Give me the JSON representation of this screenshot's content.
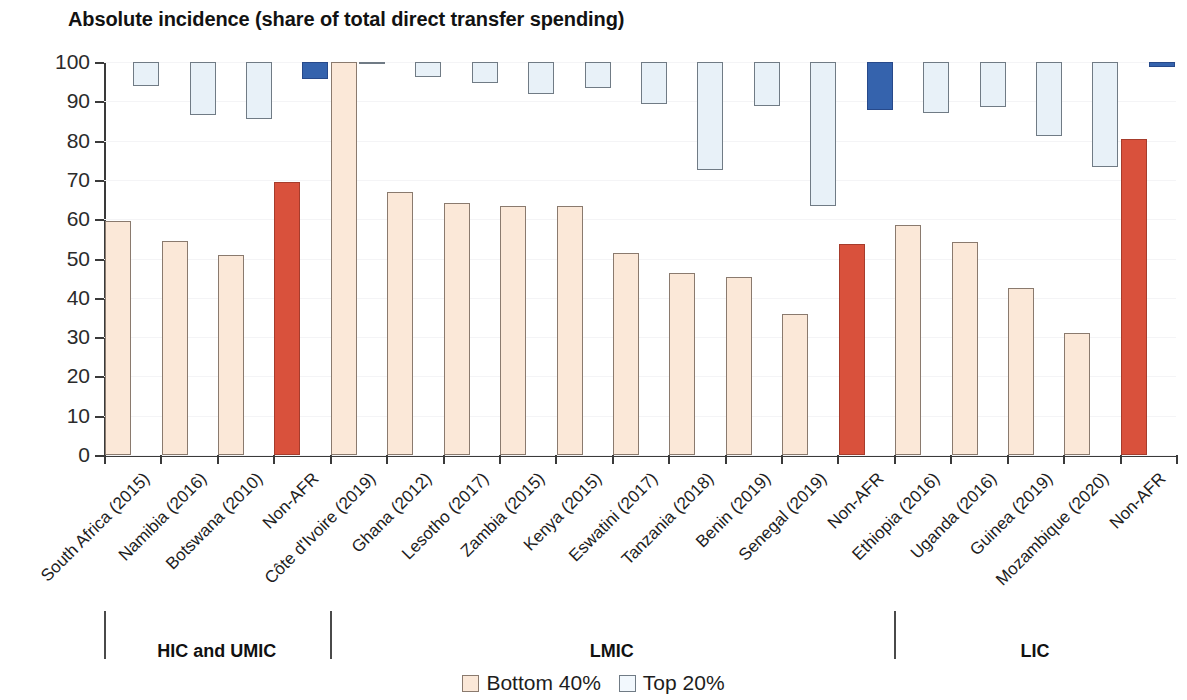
{
  "chart_data": {
    "type": "bar",
    "title": "Absolute incidence (share of total direct transfer spending)",
    "xlabel": "",
    "ylabel": "",
    "ylim": [
      0,
      100
    ],
    "yticks": [
      0,
      10,
      20,
      30,
      40,
      50,
      60,
      70,
      80,
      90,
      100
    ],
    "grid": true,
    "legend_position": "bottom-center",
    "note": "Top 20% is drawn as a floating bar spanning from its value up to 100.",
    "categories": [
      "South Africa (2015)",
      "Namibia (2016)",
      "Botswana (2010)",
      "Non-AFR",
      "Côte d'Ivoire (2019)",
      "Ghana (2012)",
      "Lesotho (2017)",
      "Zambia (2015)",
      "Kenya (2015)",
      "Eswatini (2017)",
      "Tanzania (2018)",
      "Benin (2019)",
      "Senegal (2019)",
      "Non-AFR",
      "Ethiopia (2016)",
      "Uganda (2016)",
      "Guinea (2019)",
      "Mozambique (2020)",
      "Non-AFR"
    ],
    "highlight": [
      false,
      false,
      false,
      true,
      false,
      false,
      false,
      false,
      false,
      false,
      false,
      false,
      false,
      true,
      false,
      false,
      false,
      false,
      true
    ],
    "series": [
      {
        "name": "Bottom 40%",
        "color": "#fbe8d8",
        "highlight_color": "#d9513c",
        "values": [
          59.5,
          54.5,
          51.0,
          69.5,
          100.0,
          67.0,
          64.0,
          63.3,
          63.3,
          51.3,
          46.2,
          45.3,
          36.0,
          53.6,
          58.5,
          54.3,
          42.5,
          31.0,
          80.5
        ]
      },
      {
        "name": "Top 20%",
        "color": "#e8f1f8",
        "highlight_color": "#3563ad",
        "values": [
          94.0,
          86.5,
          85.6,
          95.6,
          100.0,
          96.3,
          94.7,
          91.8,
          93.5,
          89.4,
          72.5,
          88.9,
          63.3,
          87.8,
          87.0,
          88.6,
          81.2,
          73.4,
          98.7
        ]
      }
    ],
    "groups": [
      {
        "label": "HIC and UMIC",
        "start": 0,
        "end": 3
      },
      {
        "label": "LMIC",
        "start": 4,
        "end": 13
      },
      {
        "label": "LIC",
        "start": 14,
        "end": 18
      }
    ]
  },
  "legend": {
    "items": [
      {
        "label": "Bottom 40%",
        "swatch": "bottom40-swatch"
      },
      {
        "label": "Top 20%",
        "swatch": "top20-swatch"
      }
    ]
  },
  "colors": {
    "bottom40": "#fbe8d8",
    "top20": "#e8f1f8",
    "bottom40_highlight": "#d9513c",
    "top20_highlight": "#3563ad",
    "axis": "#3a3a3a",
    "text": "#1a1a1a"
  }
}
